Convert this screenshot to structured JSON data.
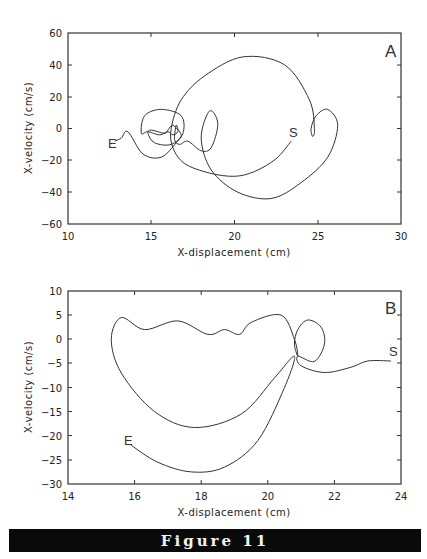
{
  "figure": {
    "caption": "Figure 11"
  },
  "chart_data": [
    {
      "type": "line",
      "panel": "A",
      "title": "",
      "xlabel": "X-displacement (cm)",
      "ylabel": "X-velocity (cm/s)",
      "xlim": [
        10,
        30
      ],
      "ylim": [
        -60,
        60
      ],
      "xticks": [
        "10",
        "15",
        "20",
        "25",
        "30"
      ],
      "yticks": [
        "60",
        "40",
        "20",
        "0",
        "-20",
        "-40",
        "-60"
      ],
      "grid": false,
      "annotations": [
        {
          "text": "A",
          "x": 29,
          "y": 52
        },
        {
          "text": "S",
          "x": 23.3,
          "y": -3
        },
        {
          "text": "E",
          "x": 13.0,
          "y": -9
        }
      ],
      "series": [
        {
          "name": "phase trajectory (S to E)",
          "points": [
            [
              23.4,
              -8
            ],
            [
              22.5,
              -19
            ],
            [
              21.2,
              -27
            ],
            [
              20.0,
              -30
            ],
            [
              18.5,
              -28
            ],
            [
              17.0,
              -22
            ],
            [
              16.3,
              -12
            ],
            [
              16.2,
              0
            ],
            [
              16.8,
              18
            ],
            [
              18.2,
              33
            ],
            [
              20.5,
              45
            ],
            [
              23.0,
              40
            ],
            [
              24.5,
              18
            ],
            [
              24.8,
              0
            ],
            [
              24.7,
              -5
            ],
            [
              24.6,
              0
            ],
            [
              24.9,
              8
            ],
            [
              25.6,
              12
            ],
            [
              26.2,
              2
            ],
            [
              25.6,
              -18
            ],
            [
              24.0,
              -34
            ],
            [
              22.2,
              -44
            ],
            [
              20.2,
              -40
            ],
            [
              18.6,
              -26
            ],
            [
              18.0,
              -6
            ],
            [
              18.5,
              11
            ],
            [
              19.0,
              3
            ],
            [
              18.6,
              -12
            ],
            [
              18.0,
              -14
            ],
            [
              17.2,
              -8
            ],
            [
              16.7,
              -10
            ],
            [
              16.4,
              -7
            ],
            [
              16.5,
              2
            ],
            [
              16.6,
              -2
            ],
            [
              16.3,
              -4
            ],
            [
              16.0,
              -2
            ],
            [
              15.5,
              -4
            ],
            [
              14.8,
              -2
            ],
            [
              14.4,
              -3
            ],
            [
              14.6,
              8
            ],
            [
              15.6,
              12
            ],
            [
              16.8,
              8
            ],
            [
              16.9,
              -3
            ],
            [
              16.2,
              -10
            ],
            [
              15.2,
              -9
            ],
            [
              14.8,
              -3
            ],
            [
              15.0,
              -1
            ],
            [
              15.8,
              -3
            ],
            [
              16.0,
              -1
            ],
            [
              16.3,
              2
            ],
            [
              16.8,
              -4
            ],
            [
              16.5,
              -9
            ],
            [
              15.6,
              -18
            ],
            [
              14.5,
              -16
            ],
            [
              13.6,
              -2
            ],
            [
              13.2,
              -6
            ],
            [
              12.8,
              -8
            ]
          ]
        }
      ]
    },
    {
      "type": "line",
      "panel": "B",
      "title": "",
      "xlabel": "X-displacement (cm)",
      "ylabel": "X-velocity (cm/s)",
      "xlim": [
        14,
        24
      ],
      "ylim": [
        -30,
        10
      ],
      "xticks": [
        "14",
        "16",
        "18",
        "20",
        "22",
        "24"
      ],
      "yticks": [
        "10",
        "5",
        "0",
        "-5",
        "-10",
        "-15",
        "-20",
        "-25",
        "-30"
      ],
      "grid": false,
      "annotations": [
        {
          "text": "B",
          "x": 23.8,
          "y": 7
        },
        {
          "text": "S",
          "x": 23.8,
          "y": -2.5
        },
        {
          "text": "E",
          "x": 15.9,
          "y": -20.5
        }
      ],
      "series": [
        {
          "name": "phase trajectory (S to E)",
          "points": [
            [
              23.7,
              -4.5
            ],
            [
              23.0,
              -4.5
            ],
            [
              22.5,
              -5.8
            ],
            [
              21.7,
              -6.9
            ],
            [
              21.0,
              -5.5
            ],
            [
              20.9,
              -3.5
            ],
            [
              21.4,
              -4.6
            ],
            [
              21.7,
              -1
            ],
            [
              21.6,
              2.5
            ],
            [
              21.2,
              4
            ],
            [
              20.9,
              2
            ],
            [
              20.8,
              -1
            ],
            [
              20.9,
              -3.5
            ],
            [
              20.8,
              0
            ],
            [
              20.4,
              5
            ],
            [
              19.5,
              3.5
            ],
            [
              19.15,
              1
            ],
            [
              18.7,
              2
            ],
            [
              18.2,
              1
            ],
            [
              17.3,
              3.8
            ],
            [
              16.3,
              2
            ],
            [
              15.6,
              4.5
            ],
            [
              15.3,
              0
            ],
            [
              15.6,
              -7
            ],
            [
              16.6,
              -15
            ],
            [
              17.8,
              -18.3
            ],
            [
              19.2,
              -15.5
            ],
            [
              20.2,
              -8
            ],
            [
              20.8,
              -3.5
            ],
            [
              20.5,
              -10
            ],
            [
              19.7,
              -21
            ],
            [
              18.7,
              -26.5
            ],
            [
              17.7,
              -27.5
            ],
            [
              16.7,
              -25.5
            ],
            [
              15.9,
              -22
            ]
          ]
        }
      ]
    }
  ]
}
